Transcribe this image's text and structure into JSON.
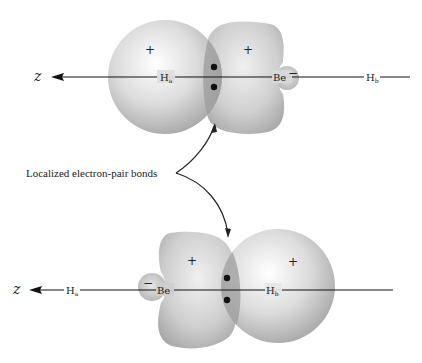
{
  "figure": {
    "annotation": "Localized electron-pair bonds",
    "colors": {
      "orbital_light": "#e4e4e4",
      "orbital_mid": "#b8b8b8",
      "overlap": "#9a9a9a",
      "line": "#111111",
      "background": "#ffffff"
    }
  },
  "top_panel": {
    "axis_label": "z",
    "atoms": [
      {
        "id": "Ha",
        "label": "H",
        "subscript": "a"
      },
      {
        "id": "Be",
        "label": "Be"
      },
      {
        "id": "Hb",
        "label": "H",
        "subscript": "b"
      }
    ],
    "signs": {
      "h_sphere": "+",
      "be_major_lobe": "+",
      "be_minor_lobe": "−"
    },
    "electron_pair": 2
  },
  "bottom_panel": {
    "axis_label": "z",
    "atoms": [
      {
        "id": "Ha",
        "label": "H",
        "subscript": "a"
      },
      {
        "id": "Be",
        "label": "Be"
      },
      {
        "id": "Hb",
        "label": "H",
        "subscript": "b"
      }
    ],
    "signs": {
      "be_minor_lobe": "−",
      "be_major_lobe": "+",
      "h_sphere": "+"
    },
    "electron_pair": 2
  }
}
